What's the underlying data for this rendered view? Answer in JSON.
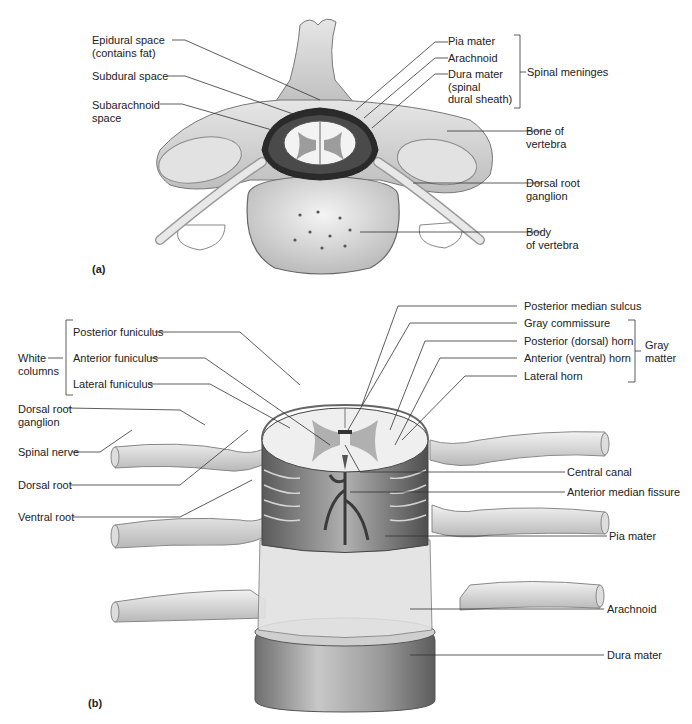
{
  "panel_a": {
    "tag": "(a)",
    "labels": {
      "epidural": "Epidural space\n(contains fat)",
      "subdural": "Subdural space",
      "subarachnoid": "Subarachnoid\nspace",
      "pia": "Pia mater",
      "arachnoid": "Arachnoid",
      "dura": "Dura mater\n(spinal\ndural sheath)",
      "meninges_group": "Spinal meninges",
      "bone": "Bone of\nvertebra",
      "drg": "Dorsal root\nganglion",
      "body": "Body\nof vertebra"
    }
  },
  "panel_b": {
    "tag": "(b)",
    "labels": {
      "white_columns": "White\ncolumns",
      "posterior_funiculus": "Posterior funiculus",
      "anterior_funiculus": "Anterior funiculus",
      "lateral_funiculus": "Lateral funiculus",
      "drg": "Dorsal root\nganglion",
      "spinal_nerve": "Spinal nerve",
      "dorsal_root": "Dorsal root",
      "ventral_root": "Ventral root",
      "posterior_median_sulcus": "Posterior median sulcus",
      "gray_commissure": "Gray commissure",
      "posterior_horn": "Posterior (dorsal) horn",
      "anterior_horn": "Anterior (ventral) horn",
      "lateral_horn": "Lateral horn",
      "gray_matter_group": "Gray\nmatter",
      "central_canal": "Central canal",
      "anterior_median_fissure": "Anterior median fissure",
      "pia": "Pia mater",
      "arachnoid": "Arachnoid",
      "dura": "Dura mater"
    }
  },
  "colors": {
    "line": "#333333",
    "bone": "#d9d9d9",
    "bone_dark": "#9a9a9a",
    "gray_matter": "#a8a8a8",
    "white_matter": "#ececec",
    "dura": "#8c8c8c",
    "vessel": "#4a4a4a"
  }
}
